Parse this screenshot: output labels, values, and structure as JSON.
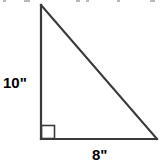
{
  "figure": {
    "name": "right-triangle-diagram",
    "type": "right-triangle",
    "background_color": "#ffffff",
    "stroke_color": "#3a3a3a",
    "label_color": "#000000",
    "vertices": {
      "apex": [
        41,
        5
      ],
      "right_angle": [
        41,
        139
      ],
      "base_right": [
        157,
        139
      ]
    },
    "right_angle_marker": {
      "name": "right-angle-square",
      "x": 41,
      "y": 125,
      "size": 14
    },
    "labels": {
      "vertical_leg": "10\"",
      "base": "8\""
    },
    "cropped_header_text_present": true,
    "crop_marks": [
      {
        "left": 3,
        "width": 3
      },
      {
        "left": 24,
        "width": 6
      },
      {
        "left": 76,
        "width": 4
      },
      {
        "left": 86,
        "width": 3
      },
      {
        "left": 117,
        "width": 3
      },
      {
        "left": 150,
        "width": 5
      }
    ]
  }
}
